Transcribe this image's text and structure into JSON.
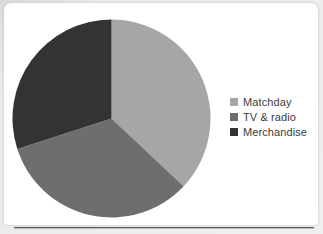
{
  "canvas": {
    "width": 323,
    "height": 234,
    "page_background": "#e9e9e9",
    "card_background": "#ffffff",
    "rule_color": "#5d5d5d"
  },
  "chart_data": {
    "type": "pie",
    "title": "",
    "subtitle": "",
    "xlabel": "",
    "ylabel": "",
    "grid": false,
    "legend_position": "right",
    "categories": [
      "Matchday",
      "TV & radio",
      "Merchandise"
    ],
    "values": [
      37,
      33,
      30
    ],
    "units": "percent",
    "colors": [
      "#a6a6a6",
      "#6e6e6e",
      "#333333"
    ],
    "start_angle_deg": 0,
    "direction": "clockwise",
    "center": {
      "x": 111,
      "y": 118
    },
    "radius": 99,
    "slices": [
      {
        "label": "Matchday",
        "value": 37,
        "color": "#a6a6a6",
        "start_deg": 0,
        "end_deg": 133
      },
      {
        "label": "TV & radio",
        "value": 33,
        "color": "#6e6e6e",
        "start_deg": 133,
        "end_deg": 252
      },
      {
        "label": "Merchandise",
        "value": 30,
        "color": "#333333",
        "start_deg": 252,
        "end_deg": 360
      }
    ]
  },
  "legend": {
    "items": [
      {
        "label": "Matchday",
        "color": "#a6a6a6"
      },
      {
        "label": "TV & radio",
        "color": "#6e6e6e"
      },
      {
        "label": "Merchandise",
        "color": "#333333"
      }
    ]
  }
}
